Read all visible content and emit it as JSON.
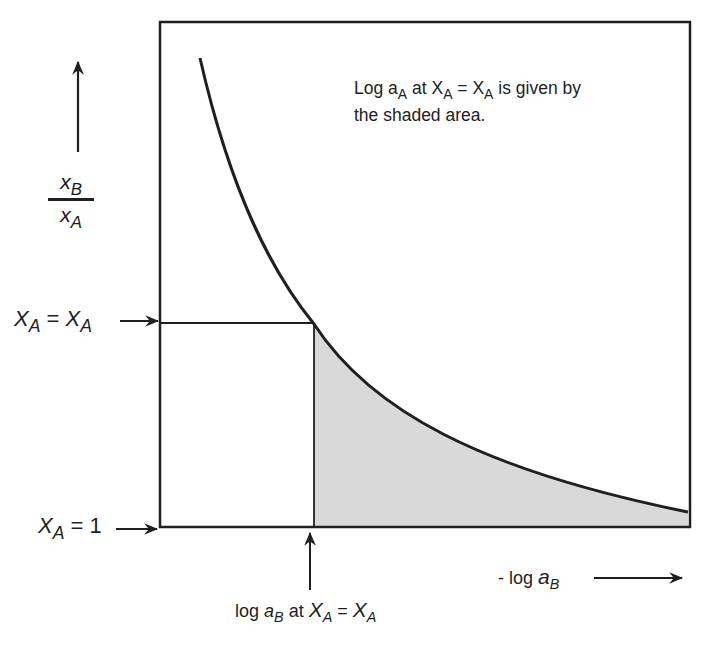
{
  "diagram": {
    "title_note": {
      "line1_prefix": "Log a",
      "line1_sub1": "A",
      "line1_mid": " at X",
      "line1_sub2": "A",
      "line1_eq": " = X",
      "line1_sub3": "A",
      "line1_suffix": " is given by",
      "line2": "the shaded area."
    },
    "y_axis": {
      "label_num": "x",
      "label_num_sub": "B",
      "label_den": "x",
      "label_den_sub": "A",
      "direction": "up-arrow"
    },
    "x_axis": {
      "label_prefix": "- log ",
      "label_var": "a",
      "label_sub": "B",
      "direction": "right-arrow"
    },
    "markers": {
      "upper_y": {
        "lhs": "X",
        "lhs_sub": "A",
        "eq": " = ",
        "rhs": "X",
        "rhs_sub": "A"
      },
      "lower_y": {
        "lhs": "X",
        "lhs_sub": "A",
        "eq": " = 1"
      },
      "x_marker": {
        "prefix": "log ",
        "var": "a",
        "var_sub": "B",
        "mid": " at ",
        "lhs": "X",
        "lhs_sub": "A",
        "eq": " = ",
        "rhs": "X",
        "rhs_sub": "A"
      }
    },
    "colors": {
      "line": "#1f1f1f",
      "shade": "#d9d9d9",
      "background": "#ffffff"
    }
  }
}
